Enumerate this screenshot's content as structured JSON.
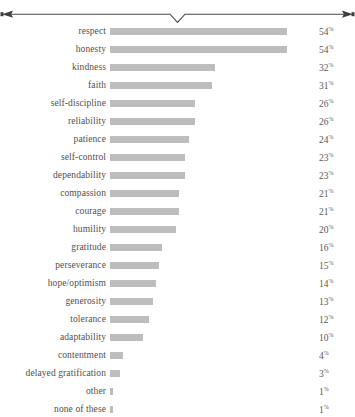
{
  "ornament": {
    "name": "horizontal-rule-with-center-v-and-arrow-ends",
    "line_color": "#4a4a4a",
    "center_marker": "v-notch",
    "end_marker": "arrowhead"
  },
  "colors": {
    "bar": "#bdbdbd",
    "label_text": "#4f4f4f",
    "value_text": "#5a5a5a",
    "background": "#ffffff",
    "rule": "#4a4a4a"
  },
  "chart_data": {
    "type": "bar",
    "orientation": "horizontal",
    "title": "",
    "xlabel": "",
    "ylabel": "",
    "grid": false,
    "legend": false,
    "xlim": [
      0,
      54
    ],
    "value_suffix": "%",
    "categories": [
      "respect",
      "honesty",
      "kindness",
      "faith",
      "self-discipline",
      "reliability",
      "patience",
      "self-control",
      "dependability",
      "compassion",
      "courage",
      "humility",
      "gratitude",
      "perseverance",
      "hope/optimism",
      "generosity",
      "tolerance",
      "adaptability",
      "contentment",
      "delayed gratification",
      "other",
      "none of these"
    ],
    "values": [
      54,
      54,
      32,
      31,
      26,
      26,
      24,
      23,
      23,
      21,
      21,
      20,
      16,
      15,
      14,
      13,
      12,
      10,
      4,
      3,
      1,
      1
    ],
    "value_labels": [
      "54",
      "54",
      "32",
      "31",
      "26",
      "26",
      "24",
      "23",
      "23",
      "21",
      "21",
      "20",
      "16",
      "15",
      "14",
      "13",
      "12",
      "10",
      "4",
      "3",
      "1",
      "1"
    ]
  }
}
